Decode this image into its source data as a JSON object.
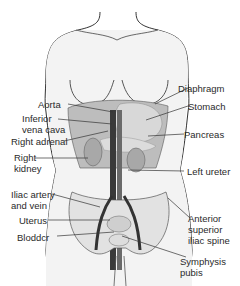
{
  "figure": {
    "labels": {
      "diaphragm": "Diaphragm",
      "aorta": "Aorta",
      "stomach": "Stomach",
      "inferior_vena_cava_1": "Inferior",
      "inferior_vena_cava_2": "vena cava",
      "right_adrenal": "Right adrenal",
      "pancreas": "Pancreas",
      "right_kidney_1": "Right",
      "right_kidney_2": "kidney",
      "left_ureter": "Left ureter",
      "iliac_1": "Iliac artery",
      "iliac_2": "and vein",
      "anterior_1": "Anterior",
      "anterior_2": "superior",
      "anterior_3": "iliac spine",
      "uterus": "Uterus",
      "bladder": "Bloddcr",
      "symphysis_1": "Symphysis",
      "symphysis_2": "pubis"
    },
    "colors": {
      "outline": "#333333",
      "skin": "#f4f4f4",
      "organ": "#cfcfcf",
      "dark_organ": "#9a9a9a",
      "vessel": "#3a3a3a",
      "leader": "#333333"
    }
  }
}
